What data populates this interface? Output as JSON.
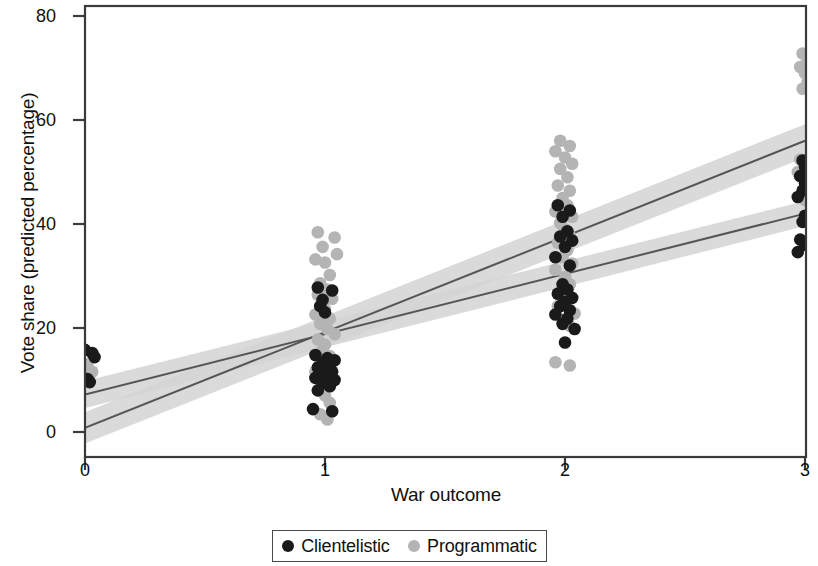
{
  "chart_data": {
    "type": "scatter",
    "title": "",
    "xlabel": "War outcome",
    "ylabel": "Vote share (predicted percentage)",
    "xlim": [
      -0.14,
      3.14
    ],
    "ylim": [
      -4,
      84
    ],
    "xticks": [
      0,
      1,
      2,
      3
    ],
    "xtick_labels": [
      "0",
      "1",
      "2",
      "3"
    ],
    "yticks": [
      0,
      20,
      40,
      60,
      80
    ],
    "ytick_labels": [
      "0",
      "20",
      "40",
      "60",
      "80"
    ],
    "grid": false,
    "legend_position": "bottom",
    "colors": {
      "clientelistic": "#1a1a1a",
      "programmatic": "#b4b4b4",
      "line": "#555555",
      "ci_band": "#d4d4d4",
      "axis": "#3a3a3a"
    },
    "series": [
      {
        "name": "Clientelistic",
        "marker": "circle",
        "color": "#1a1a1a",
        "fit_line": {
          "x": [
            0,
            3
          ],
          "y": [
            7.2,
            42.0
          ],
          "ci_halfwidth": [
            2.6,
            2.4
          ]
        },
        "points": [
          {
            "x": 0.0,
            "y": 15.8
          },
          {
            "x": 0.03,
            "y": 15.2
          },
          {
            "x": 0.04,
            "y": 14.4
          },
          {
            "x": 0.01,
            "y": 10.2
          },
          {
            "x": 0.02,
            "y": 9.6
          },
          {
            "x": 0.97,
            "y": 27.8
          },
          {
            "x": 1.03,
            "y": 27.2
          },
          {
            "x": 0.99,
            "y": 25.4
          },
          {
            "x": 0.98,
            "y": 24.2
          },
          {
            "x": 1.0,
            "y": 23.0
          },
          {
            "x": 0.96,
            "y": 14.8
          },
          {
            "x": 1.01,
            "y": 14.2
          },
          {
            "x": 1.04,
            "y": 13.8
          },
          {
            "x": 0.99,
            "y": 13.2
          },
          {
            "x": 1.02,
            "y": 12.8
          },
          {
            "x": 0.97,
            "y": 12.4
          },
          {
            "x": 1.0,
            "y": 12.0
          },
          {
            "x": 1.03,
            "y": 11.6
          },
          {
            "x": 0.98,
            "y": 11.2
          },
          {
            "x": 1.01,
            "y": 10.8
          },
          {
            "x": 0.96,
            "y": 10.4
          },
          {
            "x": 1.04,
            "y": 10.0
          },
          {
            "x": 0.99,
            "y": 9.4
          },
          {
            "x": 1.02,
            "y": 8.8
          },
          {
            "x": 0.97,
            "y": 8.0
          },
          {
            "x": 0.95,
            "y": 4.4
          },
          {
            "x": 1.03,
            "y": 4.0
          },
          {
            "x": 1.97,
            "y": 43.6
          },
          {
            "x": 2.02,
            "y": 42.6
          },
          {
            "x": 1.99,
            "y": 41.4
          },
          {
            "x": 2.01,
            "y": 38.6
          },
          {
            "x": 1.98,
            "y": 37.6
          },
          {
            "x": 2.03,
            "y": 36.8
          },
          {
            "x": 2.0,
            "y": 35.6
          },
          {
            "x": 1.96,
            "y": 33.6
          },
          {
            "x": 2.02,
            "y": 32.0
          },
          {
            "x": 1.99,
            "y": 28.4
          },
          {
            "x": 2.01,
            "y": 27.4
          },
          {
            "x": 1.97,
            "y": 26.6
          },
          {
            "x": 2.03,
            "y": 25.8
          },
          {
            "x": 2.0,
            "y": 25.0
          },
          {
            "x": 1.98,
            "y": 24.2
          },
          {
            "x": 2.02,
            "y": 23.4
          },
          {
            "x": 1.96,
            "y": 22.6
          },
          {
            "x": 2.01,
            "y": 21.8
          },
          {
            "x": 1.99,
            "y": 20.8
          },
          {
            "x": 2.04,
            "y": 19.8
          },
          {
            "x": 2.0,
            "y": 17.2
          },
          {
            "x": 2.99,
            "y": 52.2
          },
          {
            "x": 3.0,
            "y": 51.0
          },
          {
            "x": 2.98,
            "y": 49.2
          },
          {
            "x": 3.0,
            "y": 47.8
          },
          {
            "x": 2.99,
            "y": 46.4
          },
          {
            "x": 2.97,
            "y": 45.2
          },
          {
            "x": 3.0,
            "y": 41.6
          },
          {
            "x": 2.99,
            "y": 40.4
          },
          {
            "x": 2.98,
            "y": 37.0
          },
          {
            "x": 3.0,
            "y": 36.0
          },
          {
            "x": 2.97,
            "y": 34.6
          }
        ]
      },
      {
        "name": "Programmatic",
        "marker": "circle",
        "color": "#b4b4b4",
        "fit_line": {
          "x": [
            0,
            3
          ],
          "y": [
            0.8,
            56.0
          ],
          "ci_halfwidth": [
            3.0,
            3.2
          ]
        },
        "points": [
          {
            "x": 0.01,
            "y": 13.0
          },
          {
            "x": 0.0,
            "y": 12.2
          },
          {
            "x": 0.03,
            "y": 11.6
          },
          {
            "x": 0.02,
            "y": 11.0
          },
          {
            "x": 0.01,
            "y": 10.4
          },
          {
            "x": 0.97,
            "y": 38.4
          },
          {
            "x": 1.04,
            "y": 37.4
          },
          {
            "x": 0.99,
            "y": 35.6
          },
          {
            "x": 1.05,
            "y": 34.2
          },
          {
            "x": 0.96,
            "y": 33.2
          },
          {
            "x": 1.0,
            "y": 32.6
          },
          {
            "x": 1.02,
            "y": 30.2
          },
          {
            "x": 0.98,
            "y": 28.6
          },
          {
            "x": 1.01,
            "y": 27.4
          },
          {
            "x": 0.97,
            "y": 26.4
          },
          {
            "x": 1.03,
            "y": 25.6
          },
          {
            "x": 0.99,
            "y": 24.6
          },
          {
            "x": 1.0,
            "y": 23.6
          },
          {
            "x": 0.96,
            "y": 22.6
          },
          {
            "x": 1.02,
            "y": 21.8
          },
          {
            "x": 0.98,
            "y": 20.8
          },
          {
            "x": 1.01,
            "y": 19.8
          },
          {
            "x": 1.04,
            "y": 18.8
          },
          {
            "x": 0.97,
            "y": 17.8
          },
          {
            "x": 1.0,
            "y": 16.8
          },
          {
            "x": 0.99,
            "y": 15.8
          },
          {
            "x": 1.02,
            "y": 14.6
          },
          {
            "x": 0.98,
            "y": 13.6
          },
          {
            "x": 1.01,
            "y": 12.6
          },
          {
            "x": 0.96,
            "y": 11.6
          },
          {
            "x": 1.03,
            "y": 10.2
          },
          {
            "x": 0.99,
            "y": 8.8
          },
          {
            "x": 1.0,
            "y": 7.0
          },
          {
            "x": 1.02,
            "y": 5.6
          },
          {
            "x": 0.98,
            "y": 3.4
          },
          {
            "x": 1.01,
            "y": 2.4
          },
          {
            "x": 1.98,
            "y": 56.0
          },
          {
            "x": 2.02,
            "y": 55.0
          },
          {
            "x": 1.96,
            "y": 54.0
          },
          {
            "x": 2.0,
            "y": 52.8
          },
          {
            "x": 2.03,
            "y": 51.6
          },
          {
            "x": 1.98,
            "y": 50.6
          },
          {
            "x": 2.01,
            "y": 49.0
          },
          {
            "x": 1.97,
            "y": 47.4
          },
          {
            "x": 2.02,
            "y": 46.4
          },
          {
            "x": 1.99,
            "y": 45.0
          },
          {
            "x": 2.01,
            "y": 43.6
          },
          {
            "x": 1.96,
            "y": 42.4
          },
          {
            "x": 2.03,
            "y": 41.4
          },
          {
            "x": 1.98,
            "y": 40.2
          },
          {
            "x": 2.0,
            "y": 39.0
          },
          {
            "x": 2.02,
            "y": 37.8
          },
          {
            "x": 1.97,
            "y": 36.4
          },
          {
            "x": 2.01,
            "y": 35.0
          },
          {
            "x": 1.99,
            "y": 33.6
          },
          {
            "x": 2.03,
            "y": 32.4
          },
          {
            "x": 1.96,
            "y": 31.2
          },
          {
            "x": 2.0,
            "y": 29.8
          },
          {
            "x": 2.02,
            "y": 28.4
          },
          {
            "x": 1.98,
            "y": 27.0
          },
          {
            "x": 2.01,
            "y": 25.6
          },
          {
            "x": 1.97,
            "y": 24.2
          },
          {
            "x": 2.04,
            "y": 22.8
          },
          {
            "x": 1.99,
            "y": 21.6
          },
          {
            "x": 2.02,
            "y": 20.4
          },
          {
            "x": 1.96,
            "y": 13.4
          },
          {
            "x": 2.02,
            "y": 12.8
          },
          {
            "x": 2.99,
            "y": 72.8
          },
          {
            "x": 3.01,
            "y": 71.6
          },
          {
            "x": 2.98,
            "y": 70.2
          },
          {
            "x": 3.0,
            "y": 69.0
          },
          {
            "x": 3.01,
            "y": 67.2
          },
          {
            "x": 2.99,
            "y": 66.0
          },
          {
            "x": 2.98,
            "y": 52.4
          },
          {
            "x": 3.0,
            "y": 51.2
          },
          {
            "x": 2.97,
            "y": 50.0
          },
          {
            "x": 3.0,
            "y": 44.6
          }
        ]
      }
    ]
  },
  "legend": {
    "entries": [
      {
        "label": "Clientelistic",
        "color": "#1a1a1a"
      },
      {
        "label": "Programmatic",
        "color": "#b4b4b4"
      }
    ]
  }
}
